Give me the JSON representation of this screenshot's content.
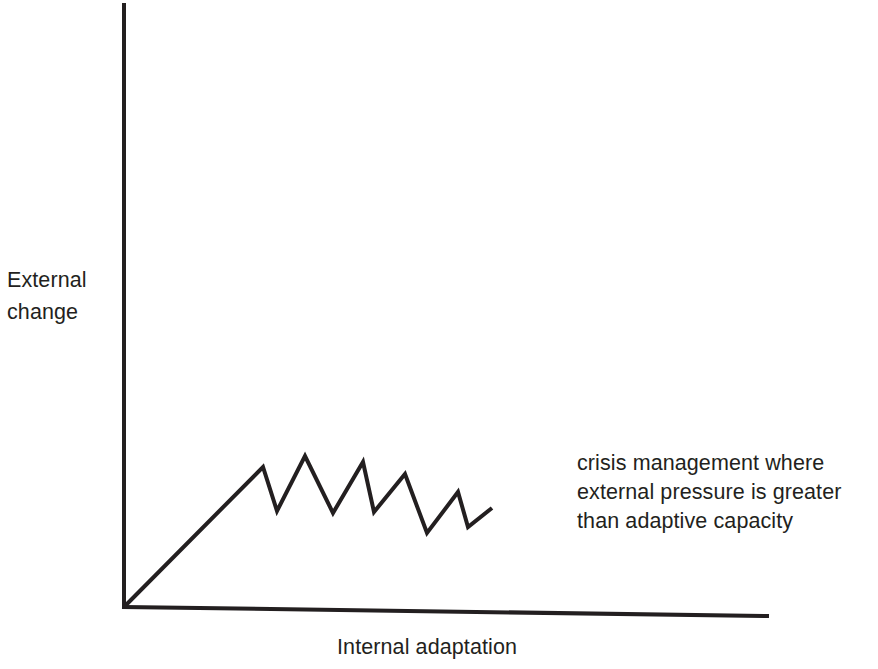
{
  "figure": {
    "background_color": "#ffffff",
    "ink_color": "#231f20",
    "axis_labels": {
      "y_line1": "External",
      "y_line2": "change",
      "x": "Internal adaptation"
    },
    "annotation": {
      "line1": "crisis management where",
      "line2": "external pressure is greater",
      "line3": "than adaptive capacity"
    }
  },
  "chart_data": {
    "type": "line",
    "title": "",
    "subtitle": "",
    "xlabel": "Internal adaptation",
    "ylabel": "External change",
    "grid": false,
    "legend": null,
    "axis_style": "open L-shaped axes with no tick marks and no numeric scale",
    "annotations": [
      {
        "text": "crisis management where external pressure is greater than adaptive capacity",
        "x_px": 577,
        "y_px": 449
      }
    ],
    "axes_px": {
      "y_axis": {
        "x": 124,
        "y_top": 5,
        "y_bottom": 607
      },
      "x_axis": {
        "y_left": 607,
        "y_right": 616,
        "x_left": 124,
        "x_right": 767
      }
    },
    "xlim": [
      0,
      1
    ],
    "ylim": [
      0,
      1
    ],
    "series": [
      {
        "name": "external change versus internal adaptation",
        "description": "steady linear rise followed by a damped sawtooth oscillation that trends downward",
        "points_px": [
          [
            124,
            607
          ],
          [
            263,
            467
          ],
          [
            277,
            511
          ],
          [
            305,
            456
          ],
          [
            333,
            513
          ],
          [
            363,
            462
          ],
          [
            374,
            512
          ],
          [
            405,
            474
          ],
          [
            427,
            533
          ],
          [
            458,
            492
          ],
          [
            468,
            527
          ],
          [
            492,
            508
          ]
        ],
        "points_normalized": [
          [
            0.0,
            0.0
          ],
          [
            0.216,
            0.233
          ],
          [
            0.238,
            0.16
          ],
          [
            0.281,
            0.251
          ],
          [
            0.325,
            0.156
          ],
          [
            0.372,
            0.241
          ],
          [
            0.389,
            0.158
          ],
          [
            0.437,
            0.221
          ],
          [
            0.471,
            0.123
          ],
          [
            0.52,
            0.191
          ],
          [
            0.535,
            0.133
          ],
          [
            0.572,
            0.165
          ]
        ]
      }
    ]
  }
}
